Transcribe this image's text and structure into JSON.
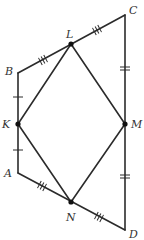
{
  "diagram": {
    "type": "geometry-figure",
    "colors": {
      "line": "#2b2b2b",
      "point": "#111111",
      "label": "#333333",
      "background": "#ffffff"
    },
    "vertices": {
      "A": {
        "label": "A",
        "x": 18,
        "y": 173
      },
      "B": {
        "label": "B",
        "x": 18,
        "y": 73
      },
      "C": {
        "label": "C",
        "x": 125,
        "y": 15
      },
      "D": {
        "label": "D",
        "x": 125,
        "y": 230
      },
      "K": {
        "label": "K",
        "x": 18,
        "y": 124
      },
      "L": {
        "label": "L",
        "x": 71,
        "y": 44
      },
      "M": {
        "label": "M",
        "x": 125,
        "y": 124
      },
      "N": {
        "label": "N",
        "x": 71,
        "y": 202
      }
    },
    "labels": {
      "A": "A",
      "B": "B",
      "C": "C",
      "D": "D",
      "K": "K",
      "L": "L",
      "M": "M",
      "N": "N"
    },
    "outer_polygon": [
      "A",
      "B",
      "C",
      "D"
    ],
    "inner_quadrilateral": [
      "K",
      "L",
      "M",
      "N"
    ],
    "marked_points": [
      "K",
      "L",
      "M",
      "N"
    ],
    "congruence_marks": [
      {
        "segment": "BK",
        "ticks": 1
      },
      {
        "segment": "KA",
        "ticks": 1
      },
      {
        "segment": "BL",
        "ticks": 3
      },
      {
        "segment": "LC",
        "ticks": 3
      },
      {
        "segment": "CM",
        "ticks": 2
      },
      {
        "segment": "MD",
        "ticks": 2
      },
      {
        "segment": "AN",
        "ticks": 3
      },
      {
        "segment": "ND",
        "ticks": 3
      }
    ]
  }
}
